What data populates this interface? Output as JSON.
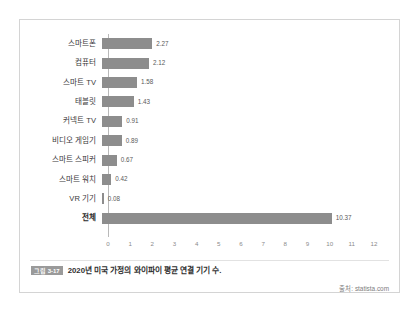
{
  "chart_data": {
    "type": "bar",
    "orientation": "horizontal",
    "title": "",
    "xlabel": "",
    "ylabel": "",
    "xlim": [
      0,
      12
    ],
    "xticks": [
      "0",
      "1",
      "2",
      "3",
      "4",
      "5",
      "6",
      "7",
      "8",
      "9",
      "10",
      "11",
      "12"
    ],
    "grid": false,
    "legend": false,
    "bar_color": "#8d8d8d",
    "categories": [
      "스마트폰",
      "컴퓨터",
      "스마트 TV",
      "태블릿",
      "커넥트 TV",
      "비디오 게임기",
      "스마트 스피커",
      "스마트 워치",
      "VR 기기",
      "전체"
    ],
    "values": [
      2.27,
      2.12,
      1.58,
      1.43,
      0.91,
      0.89,
      0.67,
      0.42,
      0.08,
      10.37
    ],
    "value_labels": [
      "2.27",
      "2.12",
      "1.58",
      "1.43",
      "0.91",
      "0.89",
      "0.67",
      "0.42",
      "0.08",
      "10.37"
    ]
  },
  "caption": {
    "badge": "그림 3-17",
    "text": "2020년 미국 가정의 와이파이 평균 연결 기기 수."
  },
  "source": {
    "text": "출처: statista.com"
  }
}
